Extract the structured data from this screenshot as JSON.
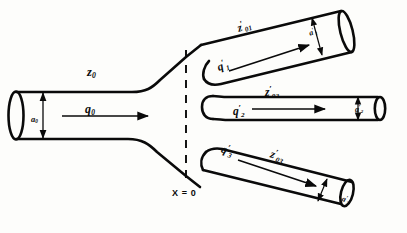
{
  "figure": {
    "background_color": "#fdfdfb",
    "line_color": "#0a0a0a"
  },
  "labels": {
    "trunk_length": {
      "sym": "z",
      "sub": "0",
      "prime": ""
    },
    "trunk_flow": {
      "sym": "q",
      "sub": "0",
      "prime": ""
    },
    "trunk_radius": {
      "sym": "a",
      "sub": "0",
      "prime": ""
    },
    "branch1_length": {
      "sym": "z",
      "sub": "01",
      "prime": "′"
    },
    "branch1_flow": {
      "sym": "q",
      "sub": "1",
      "prime": "′"
    },
    "branch1_radius": {
      "sym": "a",
      "sub": "1",
      "prime": "′"
    },
    "branch2_length": {
      "sym": "z",
      "sub": "02",
      "prime": "′"
    },
    "branch2_flow": {
      "sym": "q",
      "sub": "2",
      "prime": "′"
    },
    "branch2_radius": {
      "sym": "a",
      "sub": "2",
      "prime": "′"
    },
    "branch3_length": {
      "sym": "z",
      "sub": "03",
      "prime": "′"
    },
    "branch3_flow": {
      "sym": "q",
      "sub": "3",
      "prime": "′"
    },
    "branch3_radius": {
      "sym": "a",
      "sub": "3",
      "prime": "′"
    },
    "station_marker": "X = 0"
  }
}
